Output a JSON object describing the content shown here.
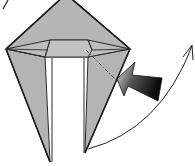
{
  "diagram": {
    "type": "origami-step",
    "colors": {
      "paper": "#b4b4b4",
      "paper_light": "#c4c4c4",
      "outline": "#2a2a2a",
      "background": "#ffffff",
      "arrow_dark": "#111111",
      "arrow_light": "#d8d8d8"
    },
    "elements": {
      "model": "kite-shaped folded paper with top flap",
      "fold_line": "dash-dot valley line",
      "push_arrow": "inside reverse fold push arrow",
      "curved_arrow": "curved arrow indicating movement upward to the right",
      "corner_mark": "small stroke at top-left"
    }
  }
}
